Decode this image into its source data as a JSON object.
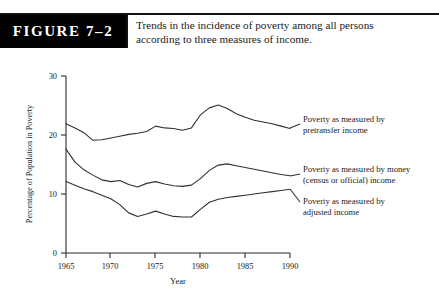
{
  "figure": {
    "tag_label": "FIGURE 7–2",
    "caption_line1": "Trends in the incidence of poverty among all persons",
    "caption_line2": "according to three measures of income.",
    "caption_full": "Trends in the incidence of poverty among all persons according to three measures of income.",
    "tag_background": "#000000",
    "tag_text_color": "#ffffff",
    "rule_color": "#111111"
  },
  "chart_data": {
    "type": "line",
    "title": "Trends in the incidence of poverty among all persons according to three measures of income.",
    "xlabel": "Year",
    "ylabel": "Percentage of Population in Poverty",
    "xlim": [
      1965,
      1990
    ],
    "ylim": [
      0,
      30
    ],
    "xticks": [
      1965,
      1970,
      1975,
      1980,
      1985,
      1990
    ],
    "yticks": [
      0,
      10,
      20,
      30
    ],
    "xtick_labels": [
      "1965",
      "1970",
      "1975",
      "1980",
      "1985",
      "1990"
    ],
    "ytick_labels": [
      "0",
      "10",
      "20",
      "30"
    ],
    "grid": false,
    "legend_position": "right-inline-labels",
    "line_color": "#303030",
    "x": [
      1965,
      1966,
      1967,
      1968,
      1969,
      1970,
      1971,
      1972,
      1973,
      1974,
      1975,
      1976,
      1977,
      1978,
      1979,
      1980,
      1981,
      1982,
      1983,
      1984,
      1985,
      1986,
      1987,
      1988,
      1989,
      1990
    ],
    "series": [
      {
        "name": "Poverty as measured by pretransfer income",
        "label_line1": "Poverty as measured by",
        "label_line2": "pretransfer income",
        "values": [
          21.9,
          21.2,
          20.4,
          19.1,
          19.2,
          19.5,
          19.8,
          20.1,
          20.3,
          20.6,
          21.5,
          21.2,
          21.1,
          20.8,
          21.2,
          23.4,
          24.6,
          25.1,
          24.5,
          23.6,
          23.0,
          22.5,
          22.2,
          21.9,
          21.5,
          21.1
        ]
      },
      {
        "name": "Poverty as measured by money (census or official) income",
        "label_line1": "Poverty as measured by money",
        "label_line2": "(census or official) income",
        "values": [
          17.6,
          15.4,
          14.1,
          13.2,
          12.4,
          12.1,
          12.3,
          11.6,
          11.2,
          11.8,
          12.1,
          11.7,
          11.4,
          11.3,
          11.5,
          12.6,
          14.0,
          14.9,
          15.1,
          14.8,
          14.5,
          14.2,
          13.9,
          13.6,
          13.3,
          13.1
        ]
      },
      {
        "name": "Poverty as measured by adjusted income",
        "label_line1": "Poverty as measured by",
        "label_line2": "adjusted income",
        "values": [
          12.1,
          11.5,
          10.9,
          10.4,
          9.8,
          9.2,
          8.2,
          6.8,
          6.2,
          6.6,
          7.1,
          6.6,
          6.2,
          6.1,
          6.1,
          7.4,
          8.6,
          9.1,
          9.4,
          9.6,
          9.8,
          10.0,
          10.2,
          10.4,
          10.6,
          10.8
        ]
      }
    ]
  }
}
